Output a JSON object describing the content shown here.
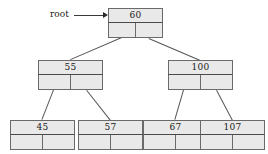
{
  "diagram": {
    "root_label": "root",
    "colors": {
      "node_fill": "#e9e9e9",
      "node_border": "#6a6a6a",
      "edge": "#555555",
      "text": "#1a1a1a",
      "background": "#ffffff"
    },
    "nodes": [
      {
        "id": "n60",
        "key": "60",
        "level": 0,
        "x": 108,
        "y": 8,
        "w": 55,
        "h": 30
      },
      {
        "id": "n55",
        "key": "55",
        "level": 1,
        "x": 38,
        "y": 60,
        "w": 65,
        "h": 30
      },
      {
        "id": "n100",
        "key": "100",
        "level": 1,
        "x": 168,
        "y": 60,
        "w": 65,
        "h": 30
      },
      {
        "id": "n45",
        "key": "45",
        "level": 2,
        "x": 10,
        "y": 120,
        "w": 65,
        "h": 30
      },
      {
        "id": "n57",
        "key": "57",
        "level": 2,
        "x": 78,
        "y": 120,
        "w": 65,
        "h": 30
      },
      {
        "id": "n67",
        "key": "67",
        "level": 2,
        "x": 143,
        "y": 120,
        "w": 65,
        "h": 30
      },
      {
        "id": "n107",
        "key": "107",
        "level": 2,
        "x": 200,
        "y": 120,
        "w": 65,
        "h": 30
      }
    ],
    "edges": [
      {
        "from": "n60",
        "to": "n55",
        "side": "left"
      },
      {
        "from": "n60",
        "to": "n100",
        "side": "right"
      },
      {
        "from": "n55",
        "to": "n45",
        "side": "left"
      },
      {
        "from": "n55",
        "to": "n57",
        "side": "right"
      },
      {
        "from": "n100",
        "to": "n67",
        "side": "left"
      },
      {
        "from": "n100",
        "to": "n107",
        "side": "right"
      }
    ],
    "root_pointer": {
      "label_x": 50,
      "label_y": 10,
      "shaft_x": 74,
      "shaft_y": 15,
      "shaft_w": 30,
      "head_x": 103,
      "head_y": 12
    }
  }
}
